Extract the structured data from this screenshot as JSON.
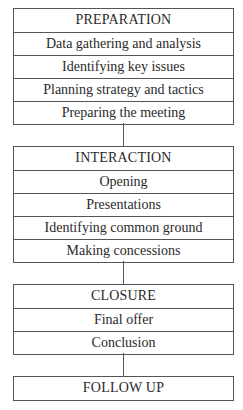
{
  "stages": [
    {
      "title": "PREPARATION",
      "items": [
        "Data gathering and analysis",
        "Identifying key issues",
        "Planning strategy and tactics",
        "Preparing the meeting"
      ]
    },
    {
      "title": "INTERACTION",
      "items": [
        "Opening",
        "Presentations",
        "Identifying common ground",
        "Making concessions"
      ]
    },
    {
      "title": "CLOSURE",
      "items": [
        "Final offer",
        "Conclusion"
      ]
    },
    {
      "title": "FOLLOW UP",
      "items": []
    }
  ],
  "colors": {
    "line": "#555555",
    "text": "#2a2a2a",
    "background": "#ffffff"
  }
}
